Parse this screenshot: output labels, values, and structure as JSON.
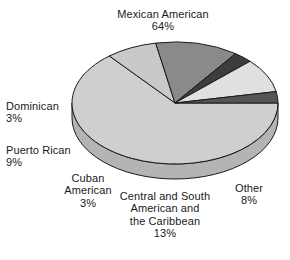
{
  "chart_data": {
    "type": "pie",
    "title": "",
    "subtitle": "",
    "xlabel": "",
    "ylabel": "",
    "legend_position": "none",
    "grid": false,
    "three_d": true,
    "units": "percent",
    "total": 100,
    "categories": [
      "Mexican American",
      "Other",
      "Central and South American and the Caribbean",
      "Cuban American",
      "Puerto Rican",
      "Dominican"
    ],
    "values": [
      64,
      8,
      13,
      3,
      9,
      3
    ],
    "slices": [
      {
        "key": "mexican",
        "name": "Mexican American",
        "value": 64,
        "value_label": "64%",
        "color": "#cfcfcf",
        "side_color": "#b4b4b4",
        "exploded": false
      },
      {
        "key": "other",
        "name": "Other",
        "value": 8,
        "value_label": "8%",
        "color": "#c9c9c9",
        "side_color": "#aeaeae",
        "exploded": false
      },
      {
        "key": "central",
        "name": "Central and South American and the Caribbean",
        "name_line1": "Central and South",
        "name_line2": "American and",
        "name_line3": "the Caribbean",
        "value": 13,
        "value_label": "13%",
        "color": "#8a8a8a",
        "side_color": "#6f6f6f",
        "exploded": false
      },
      {
        "key": "cuban",
        "name": "Cuban American",
        "name_line1": "Cuban",
        "name_line2": "American",
        "value": 3,
        "value_label": "3%",
        "color": "#3d3d3d",
        "side_color": "#2a2a2a",
        "exploded": false
      },
      {
        "key": "puerto",
        "name": "Puerto Rican",
        "value": 9,
        "value_label": "9%",
        "color": "#e0e0e0",
        "side_color": "#c2c2c2",
        "exploded": false
      },
      {
        "key": "dominican",
        "name": "Dominican",
        "value": 3,
        "value_label": "3%",
        "color": "#555555",
        "side_color": "#3b3b3b",
        "exploded": false
      }
    ],
    "geometry": {
      "center_x": 175,
      "center_y": 103,
      "radius_x": 103,
      "radius_y": 61,
      "depth": 15,
      "start_angle_deg": 0
    },
    "style": {
      "outline_color": "#1a1a1a",
      "background": "#ffffff",
      "text_color": "#1a1a1a"
    }
  },
  "labels": {
    "mexican": {
      "name": "Mexican American",
      "pct": "64%"
    },
    "dominican": {
      "name": "Dominican",
      "pct": "3%"
    },
    "puerto": {
      "name": "Puerto Rican",
      "pct": "9%"
    },
    "cuban": {
      "line1": "Cuban",
      "line2": "American",
      "pct": "3%"
    },
    "central": {
      "line1": "Central and South",
      "line2": "American and",
      "line3": "the Caribbean",
      "pct": "13%"
    },
    "other": {
      "name": "Other",
      "pct": "8%"
    }
  }
}
